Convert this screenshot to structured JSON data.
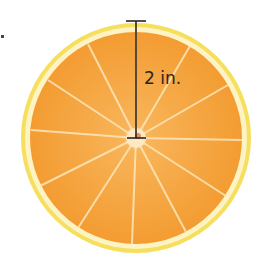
{
  "figure": {
    "measurement_label": "2 in.",
    "measurement_type": "radius",
    "colors": {
      "rind": "#f7e36a",
      "pith": "#fdf4c8",
      "flesh": "#f7a740",
      "flesh_dark": "#ef9a30",
      "segment_lines": "#fde2b0",
      "line": "#2a2420"
    }
  }
}
